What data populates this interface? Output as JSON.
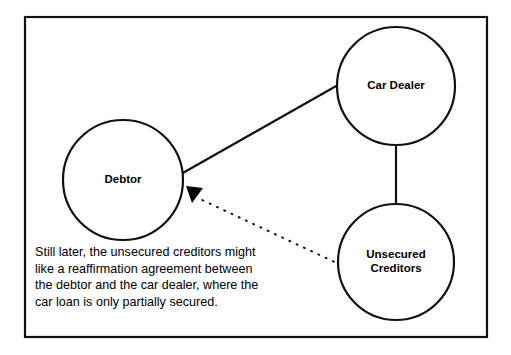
{
  "diagram": {
    "frame": {
      "x": 25,
      "y": 17,
      "width": 462,
      "height": 320,
      "stroke_color": "#111111"
    },
    "nodes": [
      {
        "id": "debtor",
        "label": "Debtor",
        "label_lines": [
          "Debtor"
        ],
        "cx": 123,
        "cy": 180,
        "r": 60
      },
      {
        "id": "car-dealer",
        "label": "Car Dealer",
        "label_lines": [
          "Car Dealer"
        ],
        "cx": 396,
        "cy": 86,
        "r": 59
      },
      {
        "id": "unsecured-creditors",
        "label": "Unsecured Creditors",
        "label_lines": [
          "Unsecured",
          "Creditors"
        ],
        "cx": 396,
        "cy": 262,
        "r": 58
      }
    ],
    "edges": [
      {
        "id": "debtor-car-dealer",
        "from": "debtor",
        "to": "car-dealer",
        "style": "solid",
        "arrow": false,
        "x1": 181,
        "y1": 174,
        "x2": 338,
        "y2": 85
      },
      {
        "id": "car-dealer-unsecured-creditors",
        "from": "car-dealer",
        "to": "unsecured-creditors",
        "style": "solid",
        "arrow": false,
        "x1": 396,
        "y1": 145,
        "x2": 396,
        "y2": 204
      },
      {
        "id": "unsecured-creditors-debtor",
        "from": "unsecured-creditors",
        "to": "debtor",
        "style": "dotted",
        "arrow": true,
        "x1": 341,
        "y1": 265,
        "x2": 200,
        "y2": 199
      }
    ],
    "arrow": {
      "id": "debtor-arrowhead",
      "points": "186,186 203,188 192,203",
      "fill": "#000000"
    },
    "caption": {
      "x": 35,
      "y": 256,
      "line_height": 16.5,
      "lines": [
        "Still later, the unsecured creditors might",
        "like a reaffirmation agreement between",
        "the debtor and the car dealer, where the",
        "car loan is only partially secured."
      ]
    }
  },
  "colors": {
    "ink": "#111111",
    "text": "#000000",
    "background": "#ffffff"
  }
}
